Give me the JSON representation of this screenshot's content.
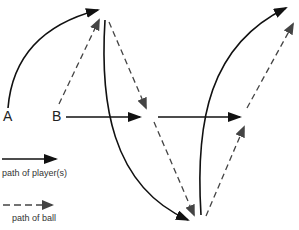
{
  "diagram": {
    "title": "",
    "players": [
      {
        "id": "A",
        "label": "A"
      },
      {
        "id": "B",
        "label": "B"
      }
    ],
    "legend": {
      "player_path": "path of player(s)",
      "ball_path": "path of ball"
    },
    "colors": {
      "player_line": "#111111",
      "ball_line": "#444444",
      "background": "#ffffff"
    },
    "paths": [
      {
        "type": "player",
        "style": "solid",
        "from": "A",
        "description": "A runs curved path up to top"
      },
      {
        "type": "ball",
        "style": "dashed",
        "from": "B",
        "description": "B passes ball up to A"
      },
      {
        "type": "player",
        "style": "solid",
        "from": "A",
        "description": "A curves down to bottom center"
      },
      {
        "type": "ball",
        "style": "dashed",
        "description": "ball passed down to middle"
      },
      {
        "type": "player",
        "style": "solid",
        "from": "B",
        "description": "B runs straight right"
      },
      {
        "type": "ball",
        "style": "dashed",
        "description": "ball passed down to bottom"
      },
      {
        "type": "player",
        "style": "solid",
        "description": "player runs straight right again"
      },
      {
        "type": "player",
        "style": "solid",
        "description": "player curves up to top right"
      },
      {
        "type": "ball",
        "style": "dashed",
        "description": "ball passed up to middle right"
      },
      {
        "type": "ball",
        "style": "dashed",
        "description": "ball passed up to top right"
      }
    ]
  }
}
